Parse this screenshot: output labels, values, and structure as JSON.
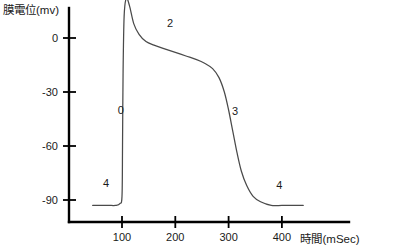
{
  "chart_data": {
    "type": "line",
    "title": "",
    "xlabel": "時間(mSec)",
    "ylabel": "膜電位(mv)",
    "xlim": [
      40,
      460
    ],
    "ylim": [
      -100,
      35
    ],
    "grid": false,
    "legend": "none",
    "x_ticks": [
      100,
      200,
      300,
      400
    ],
    "x_tick_labels": [
      "100",
      "200",
      "300",
      "400"
    ],
    "y_ticks": [
      0,
      -30,
      -60,
      -90
    ],
    "y_tick_labels": [
      "0",
      "-30",
      "-60",
      "-90"
    ],
    "series": [
      {
        "name": "cardiac-action-potential",
        "x": [
          45,
          60,
          75,
          88,
          96,
          100,
          101,
          102,
          104,
          108,
          114,
          122,
          132,
          145,
          160,
          180,
          200,
          220,
          240,
          255,
          270,
          282,
          292,
          300,
          308,
          316,
          324,
          334,
          346,
          360,
          380,
          400,
          420,
          440
        ],
        "y": [
          -93,
          -93,
          -93,
          -93,
          -92,
          -88,
          -60,
          -20,
          12,
          22,
          18,
          8,
          2,
          -2,
          -4,
          -6,
          -8,
          -10,
          -12,
          -14,
          -17,
          -22,
          -30,
          -40,
          -52,
          -64,
          -74,
          -82,
          -88,
          -91,
          -93,
          -93,
          -93,
          -93
        ]
      }
    ],
    "annotations": [
      {
        "label": "0",
        "x": 98,
        "y": -42,
        "name": "phase-0-label"
      },
      {
        "label": "1",
        "x": 133,
        "y": 28,
        "name": "phase-1-label"
      },
      {
        "label": "2",
        "x": 190,
        "y": 6,
        "name": "phase-2-label"
      },
      {
        "label": "3",
        "x": 312,
        "y": -43,
        "name": "phase-3-label"
      },
      {
        "label": "4",
        "x": 70,
        "y": -83,
        "name": "phase-4-left-label"
      },
      {
        "label": "4",
        "x": 395,
        "y": -84,
        "name": "phase-4-right-label"
      }
    ]
  }
}
